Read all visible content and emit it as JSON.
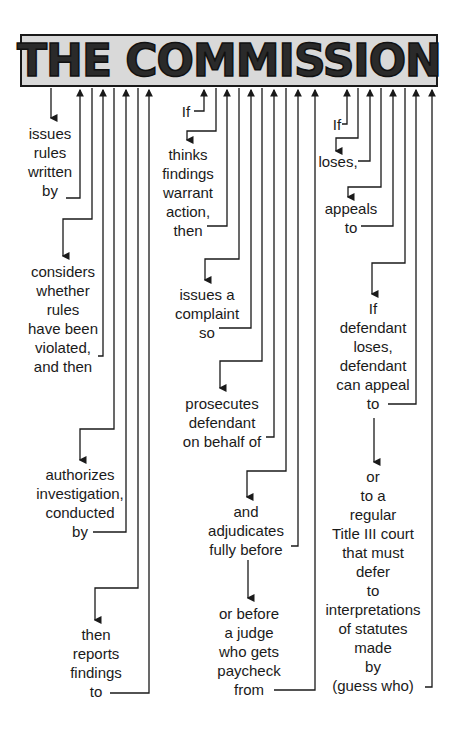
{
  "title": "THE COMMISSION",
  "colors": {
    "title_box_fill": "#d9d9d9",
    "title_text": "#2a2a2a",
    "line": "#1a1a1a",
    "text": "#1a1a1a",
    "background": "#ffffff"
  },
  "steps": {
    "issues_rules": "issues\nrules\nwritten\nby",
    "considers": "considers\nwhether\nrules\nhave been\nviolated,\nand then",
    "authorizes": "authorizes\ninvestigation,\nconducted\nby",
    "reports": "then\nreports\nfindings\nto",
    "if_1": "If",
    "thinks": "thinks\nfindings\nwarrant\naction,\nthen",
    "complaint": "issues a\ncomplaint\nso",
    "prosecutes": "prosecutes\ndefendant\non behalf of",
    "adjudicates": "and\nadjudicates\nfully before",
    "judge": "or before\na judge\nwho gets\npaycheck\nfrom",
    "if_2": "If",
    "loses": "loses,",
    "appeals": "appeals\nto",
    "defendant_loses": "If\ndefendant\nloses,\ndefendant\ncan appeal\nto",
    "title_iii": "or\nto a\nregular\nTitle III court\nthat must\ndefer\nto\ninterpretations\nof statutes\nmade\nby\n(guess who)"
  }
}
